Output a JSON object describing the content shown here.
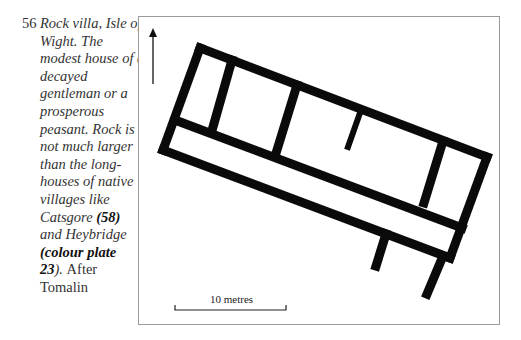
{
  "caption": {
    "figure_number": "56",
    "lines": [
      {
        "parts": [
          {
            "text": "Rock villa, Isle of",
            "style": "it"
          }
        ]
      },
      {
        "parts": [
          {
            "text": "Wight. The",
            "style": "it"
          }
        ]
      },
      {
        "parts": [
          {
            "text": "modest house of a",
            "style": "it"
          }
        ]
      },
      {
        "parts": [
          {
            "text": "decayed",
            "style": "it"
          }
        ]
      },
      {
        "parts": [
          {
            "text": "gentleman or a",
            "style": "it"
          }
        ]
      },
      {
        "parts": [
          {
            "text": "prosperous",
            "style": "it"
          }
        ]
      },
      {
        "parts": [
          {
            "text": "peasant. Rock is",
            "style": "it"
          }
        ]
      },
      {
        "parts": [
          {
            "text": "not much larger",
            "style": "it"
          }
        ]
      },
      {
        "parts": [
          {
            "text": "than the long-",
            "style": "it"
          }
        ]
      },
      {
        "parts": [
          {
            "text": "houses of native",
            "style": "it"
          }
        ]
      },
      {
        "parts": [
          {
            "text": "villages like",
            "style": "it"
          }
        ]
      },
      {
        "parts": [
          {
            "text": "Catsgore ",
            "style": "it"
          },
          {
            "text": "(58)",
            "style": "bi"
          }
        ]
      },
      {
        "parts": [
          {
            "text": "and Heybridge",
            "style": "it"
          }
        ]
      },
      {
        "parts": [
          {
            "text": "(colour plate",
            "style": "bi"
          }
        ]
      },
      {
        "parts": [
          {
            "text": "23",
            "style": "bi"
          },
          {
            "text": "). ",
            "style": "it"
          },
          {
            "text": "After",
            "style": "rm"
          }
        ]
      },
      {
        "parts": [
          {
            "text": "Tomalin",
            "style": "rm"
          }
        ]
      }
    ]
  },
  "figure": {
    "north_arrow": {
      "label": "north-arrow",
      "x": 153,
      "y_head": 28,
      "y_tail": 84
    },
    "scale_bar": {
      "label": "10 metres",
      "x1": 175,
      "x2": 286,
      "y": 310
    },
    "wall_color": "#0a0a0a",
    "frame_color": "#9a9a9a",
    "walls": [
      {
        "name": "outer-north-wall",
        "x1": 200,
        "y1": 48,
        "x2": 487,
        "y2": 157
      },
      {
        "name": "outer-east-wall",
        "x1": 487,
        "y1": 157,
        "x2": 450,
        "y2": 258
      },
      {
        "name": "outer-south-wall",
        "x1": 450,
        "y1": 258,
        "x2": 163,
        "y2": 150
      },
      {
        "name": "outer-west-wall",
        "x1": 163,
        "y1": 150,
        "x2": 200,
        "y2": 48
      },
      {
        "name": "corridor-wall",
        "x1": 175,
        "y1": 120,
        "x2": 462,
        "y2": 228
      },
      {
        "name": "cross-wall-1",
        "x1": 232,
        "y1": 60,
        "x2": 213,
        "y2": 127
      },
      {
        "name": "cross-wall-2",
        "x1": 297,
        "y1": 85,
        "x2": 277,
        "y2": 150
      },
      {
        "name": "cross-wall-3",
        "x1": 443,
        "y1": 141,
        "x2": 424,
        "y2": 203
      },
      {
        "name": "stub-wall",
        "x1": 361,
        "y1": 110,
        "x2": 348,
        "y2": 147
      },
      {
        "name": "projection-wall-1",
        "x1": 386,
        "y1": 234,
        "x2": 376,
        "y2": 266
      },
      {
        "name": "projection-wall-2",
        "x1": 443,
        "y1": 256,
        "x2": 427,
        "y2": 294
      }
    ]
  }
}
